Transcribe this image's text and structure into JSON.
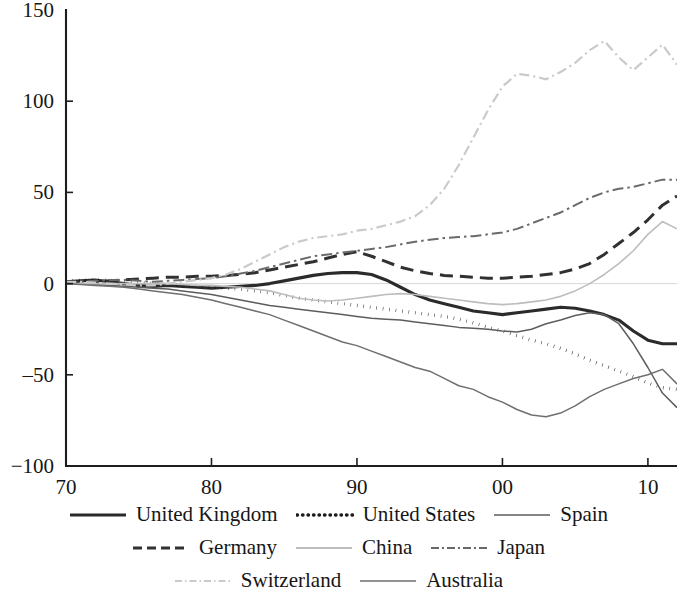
{
  "chart_data": {
    "type": "line",
    "title": "",
    "subtitle": "",
    "xlabel": "",
    "ylabel": "",
    "xlim": [
      1970,
      2012
    ],
    "ylim": [
      -100,
      150
    ],
    "grid": false,
    "legend_position": "bottom",
    "y_ticks": [
      150,
      100,
      50,
      0,
      -50,
      -100
    ],
    "y_tick_labels": [
      "150",
      "100",
      "50",
      "0",
      "‒50",
      "−100"
    ],
    "x_ticks": [
      1970,
      1980,
      1990,
      2000,
      2010
    ],
    "x_tick_labels": [
      "70",
      "80",
      "90",
      "00",
      "10"
    ],
    "x": [
      1970,
      1971,
      1972,
      1973,
      1974,
      1975,
      1976,
      1977,
      1978,
      1979,
      1980,
      1981,
      1982,
      1983,
      1984,
      1985,
      1986,
      1987,
      1988,
      1989,
      1990,
      1991,
      1992,
      1993,
      1994,
      1995,
      1996,
      1997,
      1998,
      1999,
      2000,
      2001,
      2002,
      2003,
      2004,
      2005,
      2006,
      2007,
      2008,
      2009,
      2010,
      2011,
      2012
    ],
    "series": [
      {
        "name": "United Kingdom",
        "style": "solid-thick",
        "color": "#2b2b2b",
        "width": 3.1,
        "dash": "none",
        "values": [
          1,
          1.5,
          2,
          1,
          0,
          -1,
          -1.5,
          -1,
          -1.5,
          -2,
          -2.5,
          -2,
          -1.5,
          -1,
          0,
          1.5,
          3,
          4.5,
          5.5,
          6,
          6,
          5,
          2,
          -2,
          -6,
          -9,
          -11,
          -13,
          -15,
          -16,
          -17,
          -16,
          -15,
          -14,
          -13,
          -13.5,
          -15,
          -17,
          -20,
          -26,
          -31,
          -33,
          -33
        ]
      },
      {
        "name": "United States",
        "style": "dotted",
        "color": "#1b1b1b",
        "width": 3.4,
        "dash": "0.5,6",
        "values": [
          1.5,
          1.8,
          2,
          1.8,
          1.2,
          0.5,
          0,
          -0.5,
          -1,
          -1.5,
          -2,
          -2.5,
          -3,
          -4,
          -5,
          -6.5,
          -8,
          -9,
          -10,
          -11,
          -12,
          -13,
          -14,
          -15,
          -16,
          -17,
          -18,
          -19.5,
          -21.5,
          -24,
          -26,
          -28.5,
          -31,
          -33,
          -35.5,
          -38.5,
          -42,
          -45,
          -48,
          -51,
          -54.5,
          -57,
          -58
        ]
      },
      {
        "name": "Spain",
        "style": "solid-thin",
        "color": "#5d5d5d",
        "width": 1.5,
        "dash": "none",
        "values": [
          0.5,
          0,
          -0.5,
          -1,
          -1.5,
          -2,
          -2.5,
          -3,
          -4,
          -5,
          -6,
          -7.5,
          -9,
          -10.5,
          -12,
          -13,
          -14,
          -15,
          -16,
          -17,
          -18,
          -19,
          -19.5,
          -20,
          -21,
          -22,
          -23,
          -24,
          -24.5,
          -25,
          -26,
          -26.5,
          -25,
          -22,
          -20,
          -17.5,
          -16,
          -17,
          -22,
          -33,
          -46,
          -60,
          -68
        ]
      },
      {
        "name": "Germany",
        "style": "dashed",
        "color": "#313131",
        "width": 3.0,
        "dash": "13,7",
        "values": [
          0,
          0.5,
          1,
          1.5,
          2,
          2.5,
          3,
          3.5,
          3.5,
          4,
          4,
          4.5,
          5,
          6,
          7.5,
          9,
          10.5,
          12,
          14,
          16,
          17.5,
          15,
          12,
          9,
          7,
          5.5,
          4.5,
          4,
          3.5,
          3,
          3,
          3.5,
          4,
          5,
          6,
          8,
          11,
          16,
          22,
          28,
          35,
          43,
          48
        ]
      },
      {
        "name": "China",
        "style": "solid-light",
        "color": "#bdbdbd",
        "width": 1.6,
        "dash": "none",
        "values": [
          0,
          0,
          0,
          0,
          0,
          0,
          0,
          0,
          -0.5,
          -1,
          -1,
          -1.5,
          -2,
          -3,
          -4,
          -6,
          -8,
          -9,
          -9.5,
          -9,
          -8,
          -7,
          -6,
          -5.5,
          -6,
          -7,
          -8,
          -9,
          -10,
          -11,
          -11.5,
          -11,
          -10,
          -9,
          -7,
          -4,
          0,
          5,
          11,
          18,
          27,
          34,
          30
        ]
      },
      {
        "name": "Japan",
        "style": "dash-dot",
        "color": "#6a6a6a",
        "width": 2.0,
        "dash": "11,4,2.5,4",
        "values": [
          0.5,
          1,
          1.5,
          2,
          2,
          1.5,
          1,
          1.5,
          2,
          2.5,
          3,
          4,
          5.5,
          7,
          9,
          11,
          13,
          15,
          16,
          17,
          18,
          19,
          20,
          21.5,
          23,
          24,
          25,
          25.5,
          26,
          27,
          28,
          30,
          33,
          36,
          39,
          43,
          47,
          50,
          52,
          53,
          55,
          57,
          57
        ]
      },
      {
        "name": "Switzerland",
        "style": "dash-dot-light",
        "color": "#cacaca",
        "width": 2.2,
        "dash": "10,4,2,4",
        "values": [
          1,
          1,
          0.5,
          0,
          -0.5,
          -1,
          -1,
          0,
          1,
          2,
          3,
          5,
          8,
          12,
          16,
          20,
          23,
          25,
          26,
          27,
          29,
          30,
          32,
          34,
          37,
          43,
          52,
          65,
          80,
          95,
          108,
          115,
          114,
          112,
          116,
          121,
          128,
          133,
          124,
          117,
          124,
          131,
          120
        ]
      },
      {
        "name": "Australia",
        "style": "solid-thin",
        "color": "#6f6f6f",
        "width": 1.5,
        "dash": "none",
        "values": [
          0,
          -0.5,
          -1,
          -1.5,
          -2,
          -3,
          -4,
          -5,
          -6,
          -7.5,
          -9,
          -11,
          -13,
          -15,
          -17,
          -20,
          -23,
          -26,
          -29,
          -32,
          -34,
          -37,
          -40,
          -43,
          -46,
          -48,
          -52,
          -56,
          -58,
          -62,
          -65,
          -69,
          -72,
          -73,
          -71,
          -67,
          -62,
          -58,
          -55,
          -52,
          -50,
          -47,
          -55
        ]
      }
    ]
  },
  "legend": {
    "rows": [
      [
        {
          "label": "United Kingdom",
          "swatch": "solid-thick",
          "color": "#2b2b2b"
        },
        {
          "label": "United States",
          "swatch": "dotted",
          "color": "#1b1b1b"
        },
        {
          "label": "Spain",
          "swatch": "solid-thin",
          "color": "#5d5d5d"
        }
      ],
      [
        {
          "label": "Germany",
          "swatch": "dashed",
          "color": "#313131"
        },
        {
          "label": "China",
          "swatch": "solid-light",
          "color": "#bdbdbd"
        },
        {
          "label": "Japan",
          "swatch": "dash-dot",
          "color": "#6a6a6a"
        }
      ],
      [
        {
          "label": "Switzerland",
          "swatch": "dash-dot-light",
          "color": "#cacaca"
        },
        {
          "label": "Australia",
          "swatch": "solid-thin",
          "color": "#6f6f6f"
        }
      ]
    ]
  }
}
